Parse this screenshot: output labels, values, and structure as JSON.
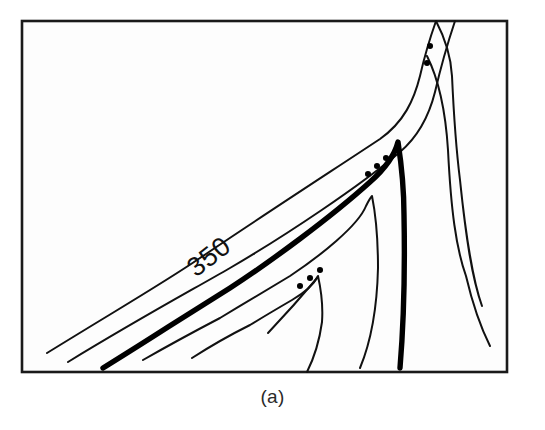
{
  "figure": {
    "caption": "(a)",
    "label_350": "350",
    "background_color": "#ffffff",
    "panel_color": "#fdfdfd",
    "line_color": "#111111",
    "bold_line_color": "#000000",
    "frame_color": "#1a1a1a"
  },
  "chart_data": {
    "type": "line",
    "title": "",
    "subtitle": "",
    "xlabel": "",
    "ylabel": "",
    "grid": false,
    "legend": null,
    "axis_ranges": {
      "x": [
        22,
        507
      ],
      "y": [
        21,
        372
      ]
    },
    "annotations": [
      {
        "name": "contour-label-350",
        "text": "350",
        "x": 222,
        "y": 262,
        "rotation": -38
      },
      {
        "name": "panel-caption",
        "text": "(a)",
        "x": 272,
        "y": 400,
        "rotation": 0
      }
    ],
    "series": [
      {
        "name": "contour-outer-1",
        "style": "thin",
        "path": "M 47 353 L 200 258 L 300 196 L 380 139 Q 408 118 420 76 Q 427 52 436 21",
        "points": [
          [
            47,
            353
          ],
          [
            200,
            258
          ],
          [
            300,
            196
          ],
          [
            380,
            139
          ],
          [
            420,
            76
          ],
          [
            436,
            21
          ]
        ]
      },
      {
        "name": "contour-outer-2",
        "style": "thin",
        "path": "M 68 362 L 230 268 L 330 204 L 400 152 Q 425 126 435 92 Q 444 60 455 21",
        "points": [
          [
            68,
            362
          ],
          [
            230,
            268
          ],
          [
            330,
            204
          ],
          [
            400,
            152
          ],
          [
            435,
            92
          ],
          [
            455,
            21
          ]
        ]
      },
      {
        "name": "contour-bold-350",
        "style": "bold",
        "label": "350",
        "path": "M 103 368 L 168 327 L 230 288 L 300 242 L 370 182 Q 392 164 398 142 Q 404 168 404 215 Q 404 290 400 368",
        "points": [
          [
            103,
            368
          ],
          [
            230,
            288
          ],
          [
            370,
            182
          ],
          [
            398,
            142
          ],
          [
            404,
            215
          ],
          [
            400,
            368
          ]
        ]
      },
      {
        "name": "contour-inner-3",
        "style": "thin",
        "path": "M 143 360 L 220 318 L 290 276 L 345 236 Q 368 216 372 196 Q 378 222 378 268 Q 376 326 360 368",
        "points": [
          [
            143,
            360
          ],
          [
            290,
            276
          ],
          [
            372,
            196
          ],
          [
            378,
            268
          ],
          [
            360,
            368
          ]
        ]
      },
      {
        "name": "contour-inner-4",
        "style": "thin",
        "path": "M 192 358 L 250 325 L 292 300 Q 312 288 318 276 Q 324 296 322 322 Q 318 352 307 372",
        "points": [
          [
            192,
            358
          ],
          [
            292,
            300
          ],
          [
            318,
            276
          ],
          [
            322,
            322
          ],
          [
            307,
            372
          ]
        ]
      },
      {
        "name": "contour-inner-5-short",
        "style": "thin",
        "path": "M 268 333 Q 296 300 318 277",
        "points": [
          [
            268,
            333
          ],
          [
            318,
            277
          ]
        ]
      },
      {
        "name": "contour-right-limb-a",
        "style": "thin",
        "path": "M 436 21 Q 450 46 452 76 Q 454 120 460 180 Q 468 250 482 306",
        "points": [
          [
            436,
            21
          ],
          [
            452,
            76
          ],
          [
            460,
            180
          ],
          [
            482,
            306
          ]
        ]
      },
      {
        "name": "contour-right-limb-b",
        "style": "thin",
        "path": "M 427 56 Q 444 96 448 150 Q 452 220 466 276 Q 476 318 490 346",
        "points": [
          [
            427,
            56
          ],
          [
            448,
            150
          ],
          [
            466,
            276
          ],
          [
            490,
            346
          ]
        ]
      }
    ],
    "trough_axes": [
      {
        "name": "trough-upper",
        "style": "dotted",
        "dots": [
          [
            430,
            46
          ],
          [
            427,
            63
          ]
        ]
      },
      {
        "name": "trough-middle",
        "style": "dotted",
        "dots": [
          [
            386,
            158
          ],
          [
            377,
            166
          ],
          [
            368,
            174
          ]
        ]
      },
      {
        "name": "trough-lower",
        "style": "dotted",
        "dots": [
          [
            320,
            270
          ],
          [
            310,
            278
          ],
          [
            300,
            286
          ]
        ]
      }
    ]
  }
}
